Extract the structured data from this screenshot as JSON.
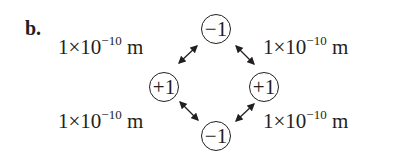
{
  "part_label": "b.",
  "distance": {
    "mantissa": "1",
    "times": "×",
    "base": "10",
    "exponent": "−10",
    "unit": "m"
  },
  "distances": [
    {
      "position": "top-left",
      "text": "1×10−10 m"
    },
    {
      "position": "top-right",
      "text": "1×10−10 m"
    },
    {
      "position": "bottom-left",
      "text": "1×10−10 m"
    },
    {
      "position": "bottom-right",
      "text": "1×10−10 m"
    }
  ],
  "charges": [
    {
      "position": "top",
      "value": "−1"
    },
    {
      "position": "left",
      "value": "+1"
    },
    {
      "position": "right",
      "value": "+1"
    },
    {
      "position": "bottom",
      "value": "−1"
    }
  ],
  "arrow_icon": "double-headed-arrow",
  "colors": {
    "ink": "#231f20",
    "background": "#ffffff"
  }
}
